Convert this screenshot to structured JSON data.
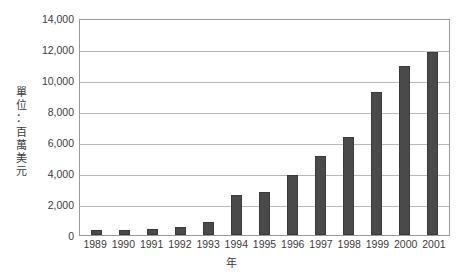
{
  "chart_data": {
    "type": "bar",
    "title": "",
    "xlabel": "年",
    "ylabel": "單位：百萬美元",
    "ylabel_chars": [
      "單",
      "位",
      "：",
      "百",
      "萬",
      "美",
      "元"
    ],
    "categories": [
      "1989",
      "1990",
      "1991",
      "1992",
      "1993",
      "1994",
      "1995",
      "1996",
      "1997",
      "1998",
      "1999",
      "2000",
      "2001"
    ],
    "values": [
      350,
      300,
      400,
      500,
      850,
      2600,
      2750,
      3850,
      5100,
      6300,
      9200,
      10900,
      11800
    ],
    "ylim": [
      0,
      14000
    ],
    "ytick_values": [
      0,
      2000,
      4000,
      6000,
      8000,
      10000,
      12000,
      14000
    ],
    "ytick_labels": [
      "0",
      "2,000",
      "4,000",
      "6,000",
      "8,000",
      "10,000",
      "12,000",
      "14,000"
    ],
    "grid": true,
    "legend": false,
    "bar_color": "#4a4a4a",
    "gridline_color": "#b8b8b8",
    "axis_color": "#9a9a9a",
    "text_color": "#3b3b3b"
  }
}
